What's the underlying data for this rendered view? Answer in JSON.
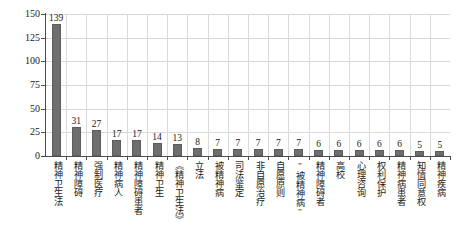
{
  "chart_data": {
    "type": "bar",
    "title": "",
    "subtitle": "",
    "xlabel": "",
    "ylabel": "文献数/篇",
    "ylim": [
      0,
      150
    ],
    "yticks": [
      0,
      25,
      50,
      75,
      100,
      125,
      150
    ],
    "grid": "both",
    "legend": "none",
    "bar_color": "#6e6e6e",
    "categories": [
      "精神卫生法",
      "精神障碍",
      "强制医疗",
      "精神病人",
      "精神障碍患者",
      "精神卫生",
      "《精神卫生法》",
      "立法",
      "被精神病",
      "司法鉴定",
      "非自愿治疗",
      "自愿原则",
      "\"被精神病\"",
      "精神障碍者",
      "高校",
      "心理咨询",
      "权利保护",
      "精神病患者",
      "知情同意权",
      "精神疾病"
    ],
    "values": [
      139,
      31,
      27,
      17,
      17,
      14,
      13,
      8,
      7,
      7,
      7,
      7,
      7,
      6,
      6,
      6,
      6,
      6,
      5,
      5
    ],
    "data_labels": [
      "139",
      "31",
      "27",
      "17",
      "17",
      "14",
      "13",
      "8",
      "7",
      "7",
      "7",
      "7",
      "7",
      "6",
      "6",
      "6",
      "6",
      "6",
      "5",
      "5"
    ]
  }
}
